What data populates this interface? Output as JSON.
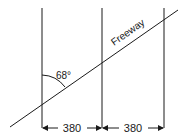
{
  "diagram": {
    "road_label": "Freeway",
    "angle_label": "68°",
    "spacing": [
      {
        "label": "380"
      },
      {
        "label": "380"
      }
    ],
    "colors": {
      "line": "#1a1a1a",
      "background": "#ffffff"
    }
  }
}
